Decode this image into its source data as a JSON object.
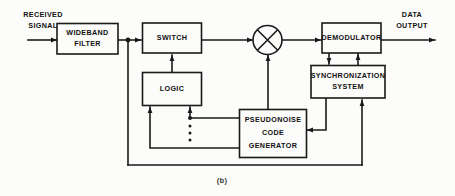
{
  "figure": {
    "caption": "(b)",
    "background_color": "#fcfcfa",
    "line_color": "#1a1a1a",
    "text_color": "#111111"
  },
  "blocks": [
    {
      "id": "wideband-filter",
      "lines": [
        "WIDEBAND",
        "FILTER"
      ]
    },
    {
      "id": "switch",
      "lines": [
        "SWITCH"
      ]
    },
    {
      "id": "logic",
      "lines": [
        "LOGIC"
      ]
    },
    {
      "id": "pseudonoise-code-generator",
      "lines": [
        "PSEUDONOISE",
        "CODE",
        "GENERATOR"
      ]
    },
    {
      "id": "demodulator",
      "lines": [
        "DEMODULATOR"
      ]
    },
    {
      "id": "synchronization-system",
      "lines": [
        "SYNCHRONIZATION",
        "SYSTEM"
      ]
    },
    {
      "id": "mixer",
      "lines": []
    }
  ],
  "edge_labels": {
    "input_line1": "RECEIVED",
    "input_line2": "SIGNAL",
    "output_line1": "DATA",
    "output_line2": "OUTPUT"
  },
  "block_text": {
    "wideband_filter_1": "WIDEBAND",
    "wideband_filter_2": "FILTER",
    "switch_1": "SWITCH",
    "logic_1": "LOGIC",
    "pn_1": "PSEUDONOISE",
    "pn_2": "CODE",
    "pn_3": "GENERATOR",
    "demodulator_1": "DEMODULATOR",
    "sync_1": "SYNCHRONIZATION",
    "sync_2": "SYSTEM"
  }
}
